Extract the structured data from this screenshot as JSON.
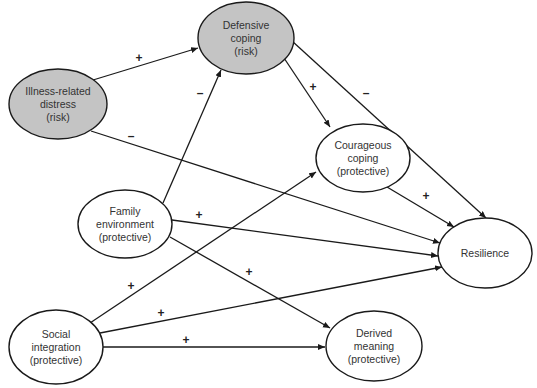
{
  "diagram": {
    "type": "path-model",
    "colors": {
      "risk_fill": "#c4c4c4",
      "protective_fill": "#ffffff",
      "stroke": "#1a1a1a",
      "text": "#333333"
    },
    "nodes": [
      {
        "id": "defensive",
        "lines": [
          "Defensive",
          "coping",
          "(risk)"
        ],
        "type": "risk",
        "cx": 246,
        "cy": 38,
        "rx": 48,
        "ry": 36
      },
      {
        "id": "illness",
        "lines": [
          "Illness-related",
          "distress",
          "(risk)"
        ],
        "type": "risk",
        "cx": 58,
        "cy": 104,
        "rx": 49,
        "ry": 35
      },
      {
        "id": "courageous",
        "lines": [
          "Courageous",
          "coping",
          "(protective)"
        ],
        "type": "protective",
        "cx": 363,
        "cy": 158,
        "rx": 47,
        "ry": 34
      },
      {
        "id": "family",
        "lines": [
          "Family",
          "environment",
          "(protective)"
        ],
        "type": "protective",
        "cx": 125,
        "cy": 224,
        "rx": 47,
        "ry": 34
      },
      {
        "id": "resilience",
        "lines": [
          "Resilience"
        ],
        "type": "protective",
        "cx": 485,
        "cy": 253,
        "rx": 47,
        "ry": 35
      },
      {
        "id": "social",
        "lines": [
          "Social",
          "integration",
          "(protective)"
        ],
        "type": "protective",
        "cx": 56,
        "cy": 347,
        "rx": 47,
        "ry": 37
      },
      {
        "id": "derived",
        "lines": [
          "Derived",
          "meaning",
          "(protective)"
        ],
        "type": "protective",
        "cx": 374,
        "cy": 346,
        "rx": 48,
        "ry": 35
      }
    ],
    "edges": [
      {
        "from": "illness",
        "to": "defensive",
        "sign": "+",
        "x1": 93,
        "y1": 80,
        "x2": 198,
        "y2": 48,
        "lx": 139,
        "ly": 62
      },
      {
        "from": "illness",
        "to": "resilience",
        "sign": "–",
        "x1": 91,
        "y1": 131,
        "x2": 440,
        "y2": 243,
        "lx": 131,
        "ly": 140
      },
      {
        "from": "family",
        "to": "defensive",
        "sign": "–",
        "x1": 163,
        "y1": 203,
        "x2": 221,
        "y2": 70,
        "lx": 200,
        "ly": 97
      },
      {
        "from": "defensive",
        "to": "courageous",
        "sign": "+",
        "x1": 284,
        "y1": 58,
        "x2": 330,
        "y2": 127,
        "lx": 313,
        "ly": 91
      },
      {
        "from": "defensive",
        "to": "resilience",
        "sign": "–",
        "x1": 292,
        "y1": 41,
        "x2": 486,
        "y2": 218,
        "lx": 366,
        "ly": 97
      },
      {
        "from": "courageous",
        "to": "resilience",
        "sign": "+",
        "x1": 387,
        "y1": 187,
        "x2": 454,
        "y2": 227,
        "lx": 426,
        "ly": 200
      },
      {
        "from": "family",
        "to": "resilience",
        "sign": "+",
        "x1": 172,
        "y1": 220,
        "x2": 438,
        "y2": 256,
        "lx": 199,
        "ly": 219
      },
      {
        "from": "family",
        "to": "derived",
        "sign": "+",
        "x1": 170,
        "y1": 237,
        "x2": 330,
        "y2": 328,
        "lx": 249,
        "ly": 276
      },
      {
        "from": "social",
        "to": "courageous",
        "sign": "+",
        "x1": 90,
        "y1": 323,
        "x2": 316,
        "y2": 172,
        "lx": 131,
        "ly": 290
      },
      {
        "from": "social",
        "to": "resilience",
        "sign": "+",
        "x1": 100,
        "y1": 333,
        "x2": 442,
        "y2": 267,
        "lx": 161,
        "ly": 317
      },
      {
        "from": "social",
        "to": "derived",
        "sign": "+",
        "x1": 103,
        "y1": 347,
        "x2": 325,
        "y2": 347,
        "lx": 186,
        "ly": 344
      }
    ]
  }
}
